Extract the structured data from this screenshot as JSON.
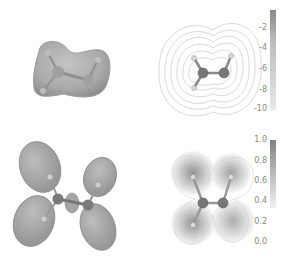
{
  "figure": {
    "panels": [
      {
        "id": "a",
        "description": "3D isosurface of molecular electrostatic potential (ethylene-like molecule)",
        "position": "top-left"
      },
      {
        "id": "b",
        "description": "2D contour map of electrostatic potential with colorbar",
        "position": "top-right"
      },
      {
        "id": "c",
        "description": "3D isosurface of orbital density lobes",
        "position": "bottom-left"
      },
      {
        "id": "d",
        "description": "2D contour map of orbital density with colorbar",
        "position": "bottom-right"
      }
    ],
    "colorbar_top": {
      "ticks": [
        "-2",
        "-4",
        "-6",
        "-8",
        "-10"
      ],
      "range": [
        -10,
        -1
      ]
    },
    "colorbar_bottom": {
      "ticks": [
        "1.0",
        "0.8",
        "0.6",
        "0.4",
        "0.2",
        "0.0"
      ],
      "range": [
        0.0,
        1.0
      ]
    },
    "colors": {
      "surface": "#a8a8a8",
      "surface_dark": "#8c8c8c",
      "atom": "#707070",
      "contour": "#c8c8c8",
      "tick_text": "#8a8a8a"
    }
  }
}
